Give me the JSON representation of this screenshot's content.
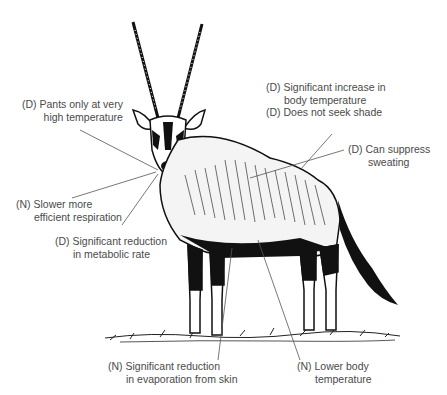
{
  "diagram": {
    "labels": [
      {
        "id": "pants",
        "line1": "(D) Pants only at very",
        "line2": "high temperature"
      },
      {
        "id": "respiration",
        "line1": "(N) Slower more",
        "line2": "efficient respiration"
      },
      {
        "id": "metabolic",
        "line1": "(D) Significant reduction",
        "line2": "in metabolic rate"
      },
      {
        "id": "body-temp-increase",
        "line1": "(D) Significant increase in",
        "line2": "body temperature"
      },
      {
        "id": "shade",
        "line1": "(D) Does not seek shade",
        "line2": ""
      },
      {
        "id": "sweating",
        "line1": "(D) Can suppress",
        "line2": "sweating"
      },
      {
        "id": "evaporation",
        "line1": "(N) Significant reduction",
        "line2": "in evaporation from skin"
      },
      {
        "id": "lower-temp",
        "line1": "(N) Lower body",
        "line2": "temperature"
      }
    ]
  }
}
